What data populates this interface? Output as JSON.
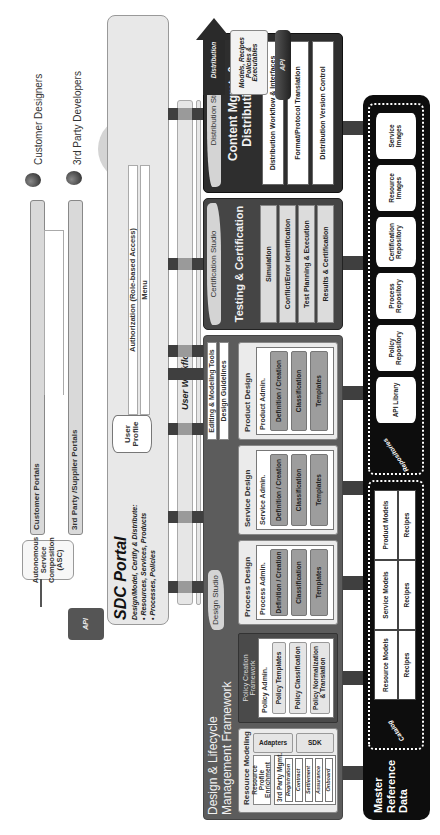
{
  "actors": {
    "customer_designers": "Customer Designers",
    "third_party_developers": "3rd Party Developers",
    "designers": "Designers"
  },
  "portals": {
    "customer": "Customer Portals",
    "third_party": "3rd Party /Supplier Portals",
    "intranet": "Intranet Portal"
  },
  "asc": {
    "label": "Autonomous Service Composition (ASC)",
    "api": "API"
  },
  "sdc_portal": {
    "title": "SDC Portal",
    "subtitle": "Design/Model, Certify & Distribute:",
    "bullets": [
      "• Resources, Services, Products",
      "• Processes, Policies"
    ],
    "user_profile": "User Profile",
    "authorization": "Authorization (Role-based Access)",
    "menu": "Menu"
  },
  "user_workflow": "User Workflow",
  "design_lifecycle": {
    "title_line1": "Design & Lifecycle",
    "title_line2": "Management Framework",
    "studio_tag": "Design Studio",
    "editing_tools": "Editing & Modeling Tools",
    "design_guidelines": "Design Guidelines",
    "resource_modeling": {
      "title": "Resource Modeling",
      "profile_enrichment": "Resource Profile Enrichment",
      "third_party_mgmt": "3rd Party Mgmt.",
      "items": [
        "Registration",
        "Contract",
        "Settlement",
        "Assurance"
      ],
      "onboard": "Onboard",
      "adapters": "Adapters",
      "sdk": "SDK"
    },
    "policy_framework": {
      "title": "Policy Creation Framework",
      "admin": "Policy Admin.",
      "items": [
        "Policy Templates",
        "Policy Classification",
        "Policy Normalization & Translation"
      ]
    },
    "process_design": {
      "title": "Process Design",
      "admin": "Process Admin.",
      "items": [
        "Definition / Creation",
        "Classification",
        "Templates"
      ]
    },
    "service_design": {
      "title": "Service Design",
      "admin": "Service Admin.",
      "items": [
        "Definition / Creation",
        "Classification",
        "Templates"
      ]
    },
    "product_design": {
      "title": "Product Design",
      "admin": "Product Admin.",
      "items": [
        "Definition / Creation",
        "Classification",
        "Templates"
      ]
    }
  },
  "certification": {
    "studio_tag": "Certification Studio",
    "title": "Testing & Certification",
    "items": [
      "Simulation",
      "Conflict/Error Identification",
      "Test Planning & Execution",
      "Results & Certification"
    ]
  },
  "distribution": {
    "studio_tag": "Distribution Studio",
    "title": "Content Mgmt. & Distribution",
    "items": [
      "Distribution Workflow & Interfaces",
      "Format/Protocol Translation",
      "Distribution Version Control"
    ],
    "arrow_label": "Distribution",
    "scroll": "Models, Recipes Policies & Executables",
    "api": "API"
  },
  "master_reference": {
    "title": "Master Reference Data",
    "catalog": {
      "label": "Catalog",
      "models": [
        "Resource Models",
        "Service Models",
        "Product Models"
      ],
      "recipes": [
        "Recipes",
        "Recipes",
        "Recipes"
      ]
    },
    "repositories": {
      "label": "Repositories",
      "items": [
        "API Library",
        "Policy Repository",
        "Process Repository",
        "Certification Repository",
        "Resource Images",
        "Service Images"
      ]
    }
  },
  "colors": {
    "dark_panel": "#5c5c5c",
    "darker_panel": "#2e2e2e",
    "black_bar": "#0d0d0d",
    "light_bg": "#e8e8e8",
    "pill_grey": "#9d9d9d"
  }
}
